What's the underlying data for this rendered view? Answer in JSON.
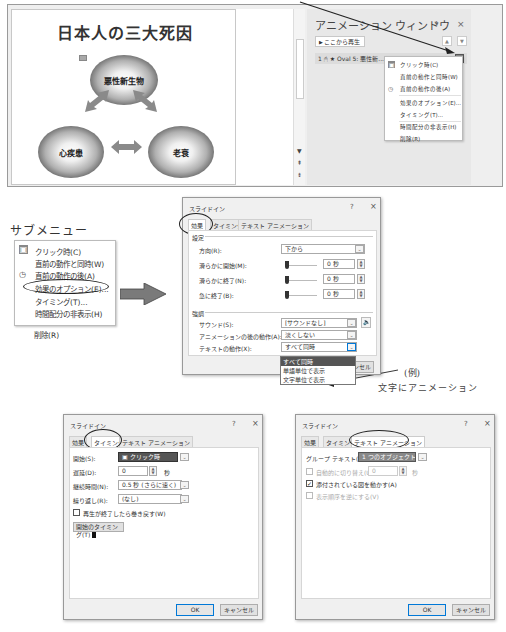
{
  "slide": {
    "title": "日本人の三大死因",
    "anim_tag": "1",
    "nodes": [
      {
        "label": "悪性新生物"
      },
      {
        "label": "心疾患"
      },
      {
        "label": "老衰"
      }
    ]
  },
  "animation_pane": {
    "title": "アニメーション ウィンドウ",
    "pin_icon": "▾",
    "close_icon": "×",
    "play_from_label": "ここから再生",
    "nav_up": "▲",
    "nav_down": "▼",
    "item": {
      "order": "1",
      "name": "Oval 5: 悪性新..."
    },
    "menu": [
      {
        "label": "クリック時(C)",
        "icon": "mouse-icon"
      },
      {
        "label": "直前の動作と同時(W)",
        "icon": ""
      },
      {
        "label": "直前の動作の後(A)",
        "icon": "clock-icon"
      },
      {
        "label": "効果のオプション(E)...",
        "icon": ""
      },
      {
        "label": "タイミング(T)...",
        "icon": ""
      },
      {
        "label": "時間配分の非表示(H)",
        "icon": ""
      },
      {
        "label": "削除(R)",
        "icon": ""
      }
    ]
  },
  "submenu_section": {
    "heading": "サブメニュー",
    "items": [
      {
        "label": "クリック時(C)"
      },
      {
        "label": "直前の動作と同時(W)"
      },
      {
        "label": "直前の動作の後(A)"
      },
      {
        "label": "効果のオプション(E)..."
      },
      {
        "label": "タイミング(T)..."
      },
      {
        "label": "時間配分の非表示(H)"
      },
      {
        "label": "削除(R)"
      }
    ]
  },
  "dialog_effect": {
    "title": "スライドイン",
    "help": "?",
    "close": "×",
    "tabs": [
      "効果",
      "タイミング",
      "テキスト アニメーション"
    ],
    "settings_group": "設定",
    "direction_label": "方向(R):",
    "direction_value": "下から",
    "smooth_start_label": "滑らかに開始(M):",
    "smooth_start_value": "0 秒",
    "smooth_end_label": "滑らかに終了(N):",
    "smooth_end_value": "0 秒",
    "bounce_end_label": "急に終了(B):",
    "bounce_end_value": "0 秒",
    "enhance_group": "強調",
    "sound_label": "サウンド(S):",
    "sound_value": "[サウンドなし]",
    "after_anim_label": "アニメーションの後の動作(A):",
    "after_anim_value": "淡くしない",
    "text_anim_label": "テキストの動作(X):",
    "text_anim_value": "すべて同時",
    "text_anim_options": [
      "すべて同時",
      "単語単位で表示",
      "文字単位で表示"
    ],
    "partial_hint": "(D)",
    "ok": "OK",
    "cancel": "キャンセル"
  },
  "annotation": {
    "line1": "(例)",
    "line2": "文字にアニメーション"
  },
  "dialog_timing": {
    "title": "スライドイン",
    "help": "?",
    "close": "×",
    "tabs": [
      "効果",
      "タイミング",
      "テキスト アニメーション"
    ],
    "start_label": "開始(S):",
    "start_value": "クリック時",
    "delay_label": "遅延(D):",
    "delay_value": "0",
    "delay_unit": "秒",
    "duration_label": "継続時間(N):",
    "duration_value": "0.5 秒 (さらに速く)",
    "repeat_label": "繰り返し(R):",
    "repeat_value": "(なし)",
    "rewind_label": "再生が終了したら巻き戻す(W)",
    "triggers_label": "開始のタイミング(T)",
    "ok": "OK",
    "cancel": "キャンセル"
  },
  "dialog_text": {
    "title": "スライドイン",
    "help": "?",
    "close": "×",
    "tabs": [
      "効果",
      "タイミング",
      "テキスト アニメーション"
    ],
    "group_text_label": "グループ テキスト(G):",
    "group_text_value": "1 つのオブジェクトとして",
    "auto_label": "自動的に切り替え(U)",
    "auto_value": "0",
    "auto_unit": "秒",
    "animate_shape_label": "添付されている図を動かす(A)",
    "animate_shape_checked": true,
    "reverse_label": "表示順序を逆にする(V)",
    "ok": "OK",
    "cancel": "キャンセル"
  },
  "colors": {
    "focus_blue": "#0078d7",
    "dropdown_selected": "#555555",
    "arrow_gray": "#8a8a8a"
  }
}
